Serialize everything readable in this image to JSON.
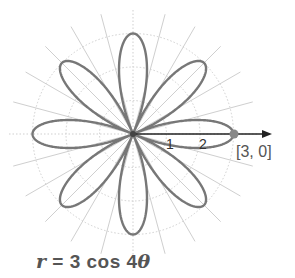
{
  "chart_data": {
    "type": "polar-line",
    "title": "r = 3 cos 4θ",
    "equation": {
      "lhs": "r",
      "amplitude": 3,
      "func": "cos",
      "k": 4,
      "var": "θ"
    },
    "petals": 8,
    "rmax": 3,
    "radial_ticks": [
      1,
      2,
      3
    ],
    "radial_tick_labels": [
      "1",
      "2"
    ],
    "angular_grid_step_deg": 15,
    "highlight_point": {
      "r": 3,
      "theta": 0,
      "label": "[3, 0]"
    },
    "grid": true
  },
  "labels": {
    "tick1": "1",
    "tick2": "2",
    "point": "[3, 0]",
    "eq_r": "r",
    "eq_rest": "= 3 cos 4",
    "eq_theta": "θ"
  },
  "colors": {
    "curve": "#777777",
    "grid": "#cfcfcf",
    "axis": "#222222",
    "text": "#555555"
  }
}
